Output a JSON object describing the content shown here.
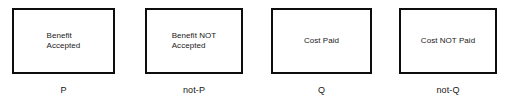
{
  "diagram": {
    "type": "propositional-logic-box-diagram",
    "background_color": "#ffffff",
    "border_color": "#0d0d0d",
    "text_color": "#1a1a1a",
    "nodes": [
      {
        "id": "p",
        "box_text": "Benefit\nAccepted",
        "label": "not used",
        "caption": "P",
        "align": "left",
        "x": 12,
        "y": 8,
        "width": 103,
        "height": 66,
        "caption_y": 85
      },
      {
        "id": "not-p",
        "box_text": "Benefit NOT\nAccepted",
        "caption": "not-P",
        "align": "left",
        "x": 145,
        "y": 8,
        "width": 98,
        "height": 66,
        "caption_y": 85
      },
      {
        "id": "q",
        "box_text": "Cost Paid",
        "caption": "Q",
        "align": "center",
        "x": 271,
        "y": 8,
        "width": 101,
        "height": 66,
        "caption_y": 85
      },
      {
        "id": "not-q",
        "box_text": "Cost NOT Paid",
        "caption": "not-Q",
        "align": "center",
        "x": 399,
        "y": 8,
        "width": 98,
        "height": 66,
        "caption_y": 85
      }
    ]
  }
}
